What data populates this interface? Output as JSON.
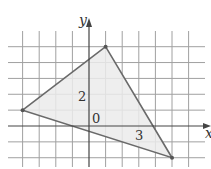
{
  "figure": {
    "axes": {
      "x_label": "x",
      "y_label": "y",
      "origin_label": "0",
      "tick_labels": [
        {
          "axis": "y",
          "value": 2,
          "text": "2"
        },
        {
          "axis": "x",
          "value": 3,
          "text": "3"
        }
      ]
    },
    "grid": {
      "x_min": -5,
      "x_max": 6,
      "y_min": -2,
      "y_max": 5,
      "unit_px_x": 16.6,
      "unit_px_y": 15.86,
      "origin_px": [
        89,
        126
      ]
    },
    "triangle": {
      "vertices": [
        [
          -4,
          1
        ],
        [
          1,
          5
        ],
        [
          5,
          -2
        ]
      ]
    },
    "colors": {
      "grid": "#a0a0a0",
      "axis": "#444444",
      "edge": "#6a6a6a",
      "fill": "#ebebeb",
      "vertex": "#555555"
    }
  }
}
